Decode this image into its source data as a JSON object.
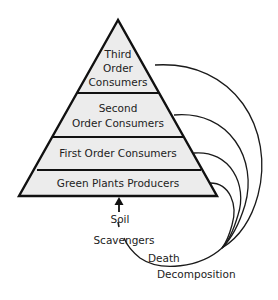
{
  "diagram": {
    "pyramid_levels": [
      {
        "id": "third-order",
        "lines": [
          "Third",
          "Order",
          "Consumers"
        ]
      },
      {
        "id": "second-order",
        "lines": [
          "Second",
          "Order Consumers"
        ]
      },
      {
        "id": "first-order",
        "lines": [
          "First Order Consumers"
        ]
      },
      {
        "id": "producers",
        "lines": [
          "Green Plants Producers"
        ]
      }
    ],
    "cycle_labels": {
      "soil": "Soil",
      "scavengers": "Scavengers",
      "death": "Death",
      "decomposition": "Decomposition"
    },
    "colors": {
      "band_fill": "#ececec",
      "stroke": "#111111",
      "background": "#ffffff"
    }
  }
}
